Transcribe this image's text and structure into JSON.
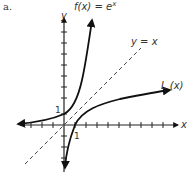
{
  "figure": {
    "label": "a.",
    "y_axis_label": "y",
    "x_axis_label": "x",
    "curve_exp_label": "f(x) = e",
    "curve_exp_superscript": "x",
    "line_label": "y = x",
    "curve_log_label": "L (x)",
    "tick_label_y": "1",
    "tick_label_x": "1"
  },
  "colors": {
    "curve": "#111111",
    "axis": "#222222",
    "dashed_line": "#444444",
    "text": "#333333"
  }
}
